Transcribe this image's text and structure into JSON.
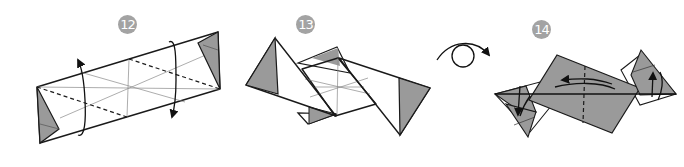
{
  "diagram": {
    "type": "origami-instructions",
    "colors": {
      "paper_back": "#ffffff",
      "paper_color": "#9a9a9a",
      "line": "#1a1a1a",
      "crease": "#8a8a8a",
      "badge_bg": "#a3a3a3",
      "badge_text": "#ffffff"
    },
    "steps": [
      {
        "number": "12",
        "description": "Long strip with colored triangles at ends; valley-fold diagonals with twist arrows"
      },
      {
        "number": "13",
        "description": "Ends swung out into triangular flaps"
      },
      {
        "number": "14",
        "description": "Model turned over; fold flaps and swing across"
      }
    ],
    "symbols": [
      {
        "name": "turn-over",
        "description": "Turn the model over"
      }
    ]
  }
}
